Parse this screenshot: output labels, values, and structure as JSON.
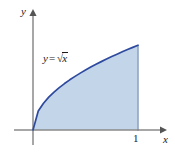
{
  "figure": {
    "name": "area-under-sqrt-curve",
    "background_color": "#ffffff",
    "axis_color": "#8a8a8a",
    "curve_color": "#2e4a9e",
    "fill_color": "#c3d5e9",
    "boundary_color": "#8fa6c4",
    "text_color": "#1a1a1a",
    "labels": {
      "y_axis": "y",
      "x_axis": "x",
      "tick_one": "1",
      "equation_lhs": "y",
      "equation_equals": "=",
      "equation_radical_sign": "√",
      "equation_radicand": "x",
      "equation_full": "y = √x"
    }
  },
  "chart_data": {
    "type": "area",
    "title": "",
    "subtitle": "",
    "xlabel": "x",
    "ylabel": "y",
    "function": "y = sqrt(x)",
    "legend": [],
    "legend_position": "none",
    "grid": false,
    "annotations": [
      {
        "text": "y = √x",
        "x": 0.28,
        "y": 0.78
      }
    ],
    "xlim": [
      0,
      1.28
    ],
    "ylim": [
      0,
      1.18
    ],
    "xticks": [
      1
    ],
    "xticklabels": [
      "1"
    ],
    "yticks": [],
    "yticklabels": [],
    "shaded_region": {
      "description": "region bounded above by y = sqrt(x), below by y = 0, right by x = 1",
      "x_from": 0,
      "x_to": 1,
      "area": 0.6667
    },
    "x": [
      0,
      0.05,
      0.1,
      0.15,
      0.2,
      0.25,
      0.3,
      0.35,
      0.4,
      0.45,
      0.5,
      0.55,
      0.6,
      0.65,
      0.7,
      0.75,
      0.8,
      0.85,
      0.9,
      0.95,
      1
    ],
    "values": [
      0,
      0.2236,
      0.3162,
      0.3873,
      0.4472,
      0.5,
      0.5477,
      0.5916,
      0.6325,
      0.6708,
      0.7071,
      0.7416,
      0.7746,
      0.8062,
      0.8367,
      0.866,
      0.8944,
      0.9219,
      0.9487,
      0.9747,
      1
    ]
  }
}
